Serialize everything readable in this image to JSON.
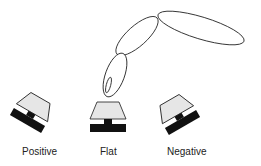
{
  "diagram": {
    "type": "keycap-tilt-illustration",
    "colors": {
      "outline": "#1a1a1a",
      "cap_fill": "#e6e6e6",
      "base_fill": "#111111",
      "background": "#ffffff"
    },
    "finger": {
      "segments": [
        "distal",
        "middle",
        "proximal"
      ],
      "has_fingernail": true
    },
    "keycaps": [
      {
        "id": "positive",
        "label": "Positive",
        "tilt_deg": 30
      },
      {
        "id": "flat",
        "label": "Flat",
        "tilt_deg": 0
      },
      {
        "id": "negative",
        "label": "Negative",
        "tilt_deg": -30
      }
    ]
  }
}
